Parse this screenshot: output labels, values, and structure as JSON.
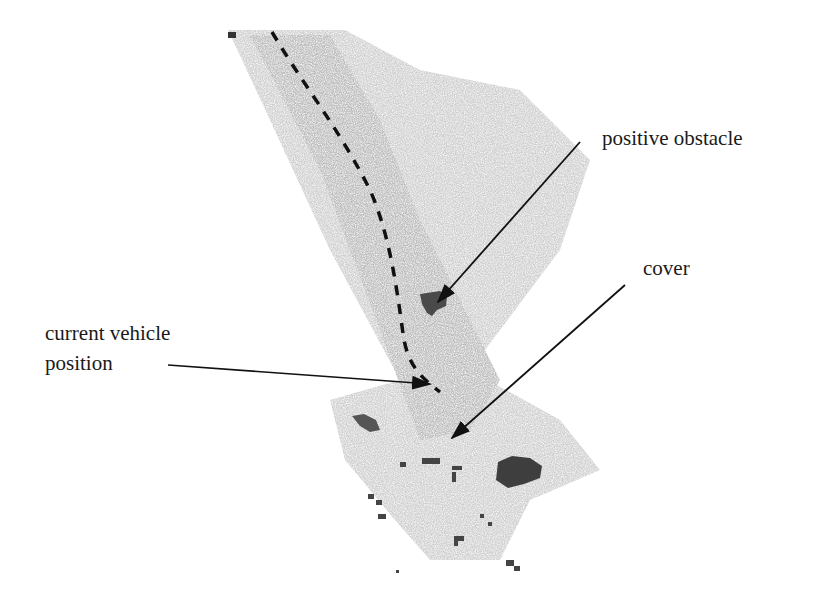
{
  "figure": {
    "labels": {
      "positive_obstacle": "positive obstacle",
      "cover": "cover",
      "current_vehicle_position_line1": "current vehicle",
      "current_vehicle_position_line2": "position"
    },
    "colors": {
      "terrain_light": "#d4d4d4",
      "terrain_mid": "#bdbdbd",
      "obstacle": "#4a4a4a",
      "path": "#111111",
      "arrow": "#111111",
      "text": "#1a1a1a"
    }
  }
}
